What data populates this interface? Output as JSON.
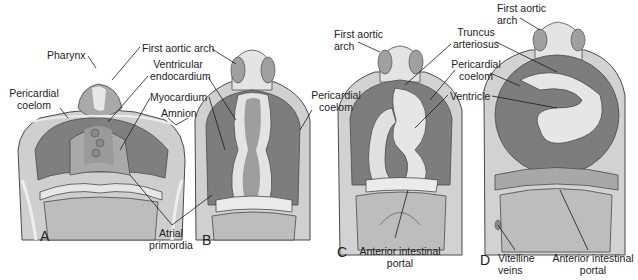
{
  "figure": {
    "type": "anatomical-diagram",
    "colors": {
      "background": "#ffffff",
      "dark_tissue": "#7a7a7a",
      "mid_tissue": "#a3a3a3",
      "light_tissue": "#d6d6d6",
      "pale_tissue": "#ececec",
      "outline": "#4a4a4a",
      "leader_line": "#1a1a1a"
    }
  },
  "panels": [
    {
      "letter": "A",
      "labels": {
        "pharynx": "Pharynx",
        "first_aortic_arch": "First aortic arch",
        "ventricular_endocardium_1": "Ventricular",
        "ventricular_endocardium_2": "endocardium",
        "pericardial_coelom_1": "Pericardial",
        "pericardial_coelom_2": "coelom",
        "myocardium": "Myocardium",
        "amnion": "Amnion",
        "atrial_primordia_1": "Atrial",
        "atrial_primordia_2": "primordia"
      }
    },
    {
      "letter": "B",
      "labels": {
        "pericardial_coelom_1": "Pericardial",
        "pericardial_coelom_2": "coelom"
      }
    },
    {
      "letter": "C",
      "labels": {
        "first_aortic_arch_1": "First aortic",
        "first_aortic_arch_2": "arch",
        "truncus_arteriosus_1": "Truncus",
        "truncus_arteriosus_2": "arteriosus",
        "pericardial_coelom_1": "Pericardial",
        "pericardial_coelom_2": "coelom",
        "ventricle": "Ventricle",
        "anterior_intestinal_portal_1": "Anterior intestinal",
        "anterior_intestinal_portal_2": "portal"
      }
    },
    {
      "letter": "D",
      "labels": {
        "first_aortic_arch_1": "First aortic",
        "first_aortic_arch_2": "arch",
        "vitelline_veins_1": "Vitelline",
        "vitelline_veins_2": "veins",
        "anterior_intestinal_portal_1": "Anterior intestinal",
        "anterior_intestinal_portal_2": "portal"
      }
    }
  ]
}
